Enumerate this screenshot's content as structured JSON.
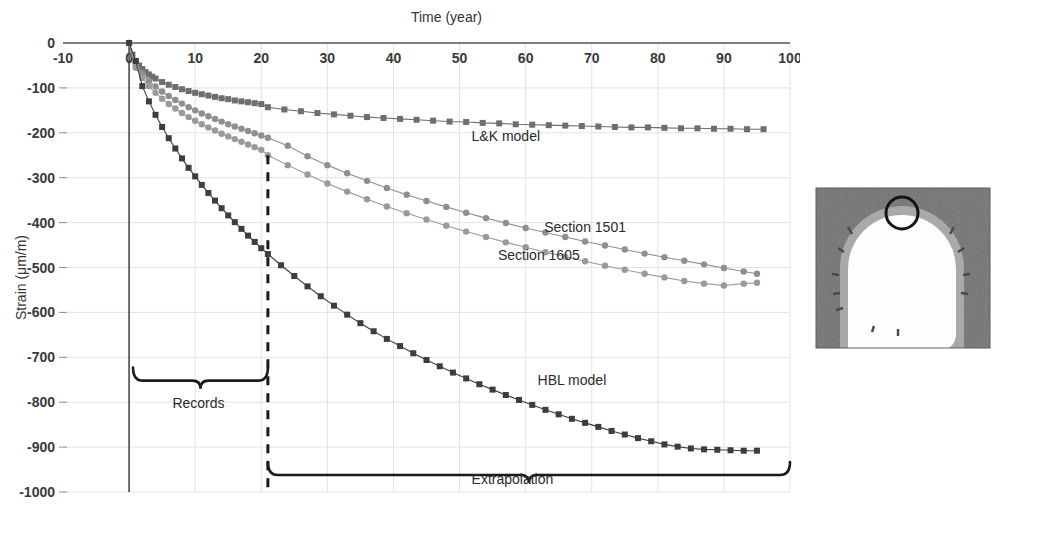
{
  "figure": {
    "title_top": "Time (year)",
    "ylabel": "Strain (μm/m)",
    "records_label": "Records",
    "extrapolation_label": "Extrapolation",
    "inset_name": "tunnel-cross-section-photo",
    "inset_marker_label": ""
  },
  "colors": {
    "lk_model": "#6e6e6e",
    "section_1501": "#8f8f8f",
    "section_1605": "#9a9a9a",
    "hbl_model": "#3d3d3d",
    "grid": "#e3e3e3",
    "axis": "#555555",
    "annotation": "#1a1a1a"
  },
  "chart_data": {
    "type": "line",
    "title": "",
    "xlabel": "Time (year)",
    "ylabel": "Strain (μm/m)",
    "xlim": [
      -10,
      100
    ],
    "ylim": [
      -1000,
      0
    ],
    "xticks": [
      -10,
      0,
      10,
      20,
      30,
      40,
      50,
      60,
      70,
      80,
      90,
      100
    ],
    "xticklabels": [
      "-10",
      "0",
      "10",
      "20",
      "30",
      "40",
      "50",
      "60",
      "70",
      "80",
      "90",
      "100"
    ],
    "yticks": [
      0,
      -100,
      -200,
      -300,
      -400,
      -500,
      -600,
      -700,
      -800,
      -900,
      -1000
    ],
    "yticklabels": [
      "0",
      "-100",
      "-200",
      "-300",
      "-400",
      "-500",
      "-600",
      "-700",
      "-800",
      "-900",
      "-1000"
    ],
    "grid": true,
    "legend_position": "inline-annotations",
    "xaxis_position": "top",
    "annotations": [
      {
        "text": "L&K model",
        "x": 57,
        "y": -218
      },
      {
        "text": "Section 1501",
        "x": 69,
        "y": -420
      },
      {
        "text": "Section 1605",
        "x": 62,
        "y": -484
      },
      {
        "text": "HBL model",
        "x": 67,
        "y": -762
      },
      {
        "text": "Records",
        "x": 10.5,
        "y": -812,
        "type": "brace-label"
      },
      {
        "text": "Extrapolation",
        "x": 58,
        "y": -982,
        "type": "brace-label"
      }
    ],
    "divider_line": {
      "x": 21,
      "y_top": -250,
      "y_bottom": -1000,
      "style": "dashed"
    },
    "braces": [
      {
        "name": "records",
        "x_start": 0.6,
        "x_end": 21,
        "y": -752
      },
      {
        "name": "extrapolation",
        "x_start": 21,
        "x_end": 100,
        "y": -962
      }
    ],
    "series": [
      {
        "name": "L&K model",
        "marker": "square",
        "color": "#6e6e6e",
        "x": [
          0,
          0.5,
          1,
          1.5,
          2,
          2.5,
          3,
          3.5,
          4,
          5,
          6,
          7,
          8,
          9,
          10,
          11,
          12,
          13,
          14,
          15,
          16,
          17,
          18,
          19,
          20,
          21,
          23.5,
          26,
          28.5,
          31,
          33.5,
          36,
          38.5,
          41,
          43.5,
          46,
          48.5,
          51,
          53.5,
          56,
          58.5,
          61,
          63.5,
          66,
          68.5,
          71,
          73.5,
          76,
          78.5,
          81,
          83.5,
          86,
          88.5,
          91,
          93.5,
          96
        ],
        "y": [
          0,
          -26,
          -40,
          -50,
          -58,
          -65,
          -70,
          -75,
          -79,
          -87,
          -93,
          -98,
          -103,
          -107,
          -111,
          -114,
          -117,
          -120,
          -123,
          -125,
          -128,
          -130,
          -132,
          -134,
          -136,
          -143,
          -148,
          -152,
          -156,
          -159,
          -162,
          -165,
          -167,
          -169,
          -171,
          -173,
          -175,
          -176,
          -178,
          -179,
          -181,
          -182,
          -183,
          -184,
          -185,
          -186,
          -187,
          -188,
          -188,
          -189,
          -190,
          -190,
          -191,
          -191,
          -192,
          -192
        ]
      },
      {
        "name": "Section 1501",
        "marker": "circle",
        "color": "#8f8f8f",
        "x": [
          0,
          1,
          2,
          3,
          4,
          5,
          6,
          7,
          8,
          9,
          10,
          11,
          12,
          13,
          14,
          15,
          16,
          17,
          18,
          19,
          20,
          21,
          24,
          27,
          30,
          33,
          36,
          39,
          42,
          45,
          48,
          51,
          54,
          57,
          60,
          63,
          66,
          69,
          72,
          75,
          78,
          81,
          84,
          87,
          90,
          93,
          95
        ],
        "y": [
          0,
          -48,
          -68,
          -84,
          -97,
          -108,
          -118,
          -127,
          -135,
          -143,
          -150,
          -157,
          -163,
          -169,
          -175,
          -181,
          -186,
          -191,
          -196,
          -201,
          -206,
          -211,
          -229,
          -252,
          -272,
          -290,
          -307,
          -323,
          -338,
          -352,
          -365,
          -378,
          -390,
          -401,
          -412,
          -422,
          -432,
          -442,
          -451,
          -460,
          -469,
          -477,
          -485,
          -493,
          -501,
          -509,
          -514
        ]
      },
      {
        "name": "Section 1605",
        "marker": "circle",
        "color": "#9a9a9a",
        "x": [
          0,
          1,
          2,
          3,
          4,
          5,
          6,
          7,
          8,
          9,
          10,
          11,
          12,
          13,
          14,
          15,
          16,
          17,
          18,
          19,
          20,
          21,
          24,
          27,
          30,
          33,
          36,
          39,
          42,
          45,
          48,
          51,
          54,
          57,
          60,
          63,
          66,
          69,
          72,
          75,
          78,
          81,
          84,
          87,
          90,
          93,
          95
        ],
        "y": [
          0,
          -55,
          -78,
          -96,
          -111,
          -124,
          -136,
          -146,
          -156,
          -165,
          -173,
          -181,
          -188,
          -195,
          -202,
          -208,
          -214,
          -220,
          -226,
          -232,
          -238,
          -250,
          -272,
          -293,
          -313,
          -331,
          -348,
          -364,
          -379,
          -393,
          -407,
          -420,
          -432,
          -444,
          -455,
          -466,
          -476,
          -486,
          -496,
          -505,
          -514,
          -522,
          -530,
          -536,
          -540,
          -536,
          -534
        ]
      },
      {
        "name": "HBL model",
        "marker": "square",
        "color": "#3d3d3d",
        "x": [
          0,
          1,
          2,
          3,
          4,
          5,
          6,
          7,
          8,
          9,
          10,
          11,
          12,
          13,
          14,
          15,
          16,
          17,
          18,
          19,
          20,
          21,
          23,
          25,
          27,
          29,
          31,
          33,
          35,
          37,
          39,
          41,
          43,
          45,
          47,
          49,
          51,
          53,
          55,
          57,
          59,
          61,
          63,
          65,
          67,
          69,
          71,
          73,
          75,
          77,
          79,
          81,
          83,
          85,
          87,
          89,
          91,
          93,
          95
        ],
        "y": [
          0,
          -40,
          -96,
          -130,
          -160,
          -187,
          -212,
          -235,
          -257,
          -278,
          -297,
          -316,
          -334,
          -351,
          -368,
          -384,
          -399,
          -414,
          -429,
          -443,
          -457,
          -470,
          -495,
          -519,
          -542,
          -564,
          -585,
          -605,
          -624,
          -642,
          -659,
          -675,
          -691,
          -706,
          -720,
          -734,
          -747,
          -760,
          -772,
          -784,
          -795,
          -806,
          -817,
          -827,
          -837,
          -846,
          -855,
          -864,
          -872,
          -880,
          -887,
          -894,
          -899,
          -903,
          -905,
          -906,
          -907,
          -908,
          -908
        ]
      }
    ]
  }
}
